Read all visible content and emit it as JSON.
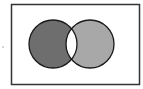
{
  "diagram": {
    "type": "venn",
    "frame": {
      "x": 11,
      "y": 4,
      "width": 129,
      "height": 80,
      "stroke": "#333333",
      "fill": "#ffffff"
    },
    "sets": [
      {
        "name": "A",
        "cx": 53,
        "cy": 44,
        "r": 24,
        "fill": "#6e6e6e"
      },
      {
        "name": "B",
        "cx": 90,
        "cy": 44,
        "r": 24,
        "fill": "#a8a8a8"
      }
    ],
    "intersection_fill": "#ffffff",
    "outline": "#1a1a1a"
  }
}
